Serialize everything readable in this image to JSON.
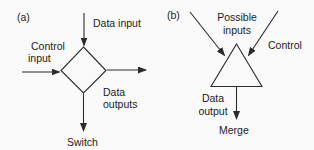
{
  "figure": {
    "colors": {
      "background": "#fafafa",
      "line": "#2b2b2b",
      "text": "#1c1c1c"
    },
    "panel_a": {
      "tag": "(a)",
      "node_shape": "diamond",
      "caption": "Switch",
      "labels": {
        "data_input": "Data input",
        "control_input": [
          "Control",
          "input"
        ],
        "data_outputs": [
          "Data",
          "outputs"
        ]
      }
    },
    "panel_b": {
      "tag": "(b)",
      "node_shape": "triangle",
      "caption": "Merge",
      "labels": {
        "possible_inputs": [
          "Possible",
          "inputs"
        ],
        "control": "Control",
        "data_output": [
          "Data",
          "output"
        ]
      }
    }
  }
}
